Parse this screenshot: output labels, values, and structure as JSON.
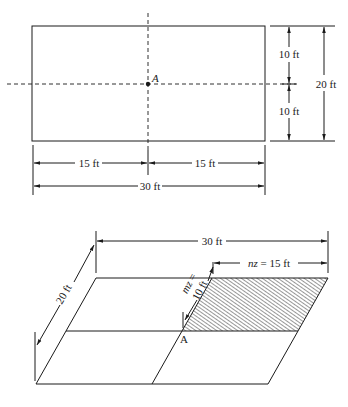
{
  "plan_view": {
    "point_label": "A",
    "dim_top_half": "10 ft",
    "dim_bottom_half": "10 ft",
    "dim_total_height": "20 ft",
    "dim_left_half": "15 ft",
    "dim_right_half": "15 ft",
    "dim_total_width": "30 ft"
  },
  "isometric_view": {
    "point_label": "A",
    "dim_width": "30 ft",
    "dim_depth": "20 ft",
    "dim_mz_var": "mz",
    "dim_mz_eq": " = ",
    "dim_mz_val": "10 ft",
    "dim_nz_var": "nz",
    "dim_nz_rest": " = 15 ft",
    "hatch_color": "#1a1a1a"
  }
}
